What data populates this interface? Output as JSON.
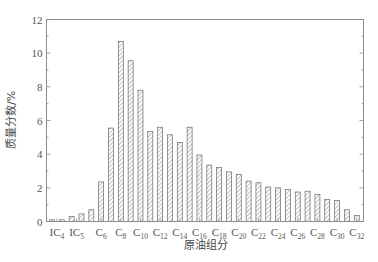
{
  "chart_data": {
    "type": "bar",
    "title": "",
    "xlabel": "原油组分",
    "ylabel": "质量分数/%",
    "ylim": [
      0,
      12
    ],
    "yticks": [
      0,
      2,
      4,
      6,
      8,
      10,
      12
    ],
    "grid": false,
    "legend": null,
    "bar_style": "hatched",
    "categories": [
      "IC4",
      "nC4",
      "IC5",
      "nC5",
      "C5+",
      "C6",
      "C7",
      "C8",
      "C9",
      "C10",
      "C11",
      "C12",
      "C13",
      "C14",
      "C15",
      "C16",
      "C17",
      "C18",
      "C19",
      "C20",
      "C21",
      "C22",
      "C23",
      "C24",
      "C25",
      "C26",
      "C27",
      "C28",
      "C29",
      "C30",
      "C31",
      "C32"
    ],
    "values": [
      0.1,
      0.1,
      0.3,
      0.45,
      0.7,
      2.35,
      5.55,
      10.7,
      9.55,
      7.8,
      5.35,
      5.6,
      5.15,
      4.7,
      5.6,
      3.95,
      3.35,
      3.2,
      2.95,
      2.8,
      2.4,
      2.3,
      2.05,
      2.0,
      1.9,
      1.75,
      1.8,
      1.6,
      1.3,
      1.25,
      0.7,
      0.35
    ],
    "xtick_labels": [
      {
        "main": "IC",
        "sub": "4",
        "pos": 0.5
      },
      {
        "main": "IC",
        "sub": "5",
        "pos": 2.5
      },
      {
        "main": "C",
        "sub": "6",
        "pos": 5
      },
      {
        "main": "C",
        "sub": "8",
        "pos": 7
      },
      {
        "main": "C",
        "sub": "10",
        "pos": 9
      },
      {
        "main": "C",
        "sub": "12",
        "pos": 11
      },
      {
        "main": "C",
        "sub": "14",
        "pos": 13
      },
      {
        "main": "C",
        "sub": "16",
        "pos": 15
      },
      {
        "main": "C",
        "sub": "18",
        "pos": 17
      },
      {
        "main": "C",
        "sub": "20",
        "pos": 19
      },
      {
        "main": "C",
        "sub": "22",
        "pos": 21
      },
      {
        "main": "C",
        "sub": "24",
        "pos": 23
      },
      {
        "main": "C",
        "sub": "26",
        "pos": 25
      },
      {
        "main": "C",
        "sub": "28",
        "pos": 27
      },
      {
        "main": "C",
        "sub": "30",
        "pos": 29
      },
      {
        "main": "C",
        "sub": "32",
        "pos": 31
      }
    ]
  },
  "axes": {
    "x_title": "原油组分",
    "y_title": "质量分数/%"
  },
  "colors": {
    "bar_stroke": "#6a6a6a",
    "hatch": "#8a8a8a",
    "axis": "#8c8c8c"
  }
}
